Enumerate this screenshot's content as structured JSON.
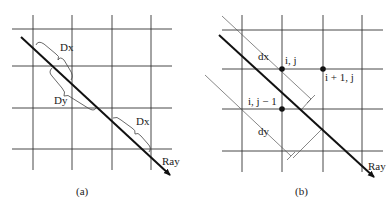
{
  "panel_a": {
    "caption": "(a)",
    "labels": {
      "dx_top": "Dx",
      "dy": "Dy",
      "dx_bottom": "Dx",
      "ray": "Ray"
    }
  },
  "panel_b": {
    "caption": "(b)",
    "labels": {
      "dx": "dx",
      "dy": "dy",
      "point_ij": "i, j",
      "point_i1j": "i + 1, j",
      "point_ij1": "i, j − 1",
      "ray": "Ray"
    }
  },
  "colors": {
    "grid": "#333333",
    "ray": "#111111",
    "guide": "#555555",
    "dot": "#111111"
  }
}
